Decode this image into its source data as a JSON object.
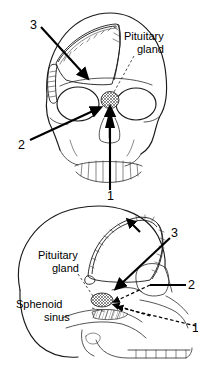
{
  "figure": {
    "stroke_color": "#1a1a1a",
    "background_color": "#ffffff"
  },
  "panels": [
    {
      "id": "frontal-skull",
      "view": "anterior",
      "labels": [
        {
          "id": "pituitary-gland-top",
          "text_line1": "Pituitary",
          "text_line2": "gland",
          "x": 124,
          "y": 37
        }
      ],
      "callouts": [
        {
          "id": "callout-3-top",
          "number": "3",
          "x": 33,
          "y": 25,
          "route": "transcranial craniotomy bone flap"
        },
        {
          "id": "callout-2-top",
          "number": "2",
          "x": 21,
          "y": 146,
          "route": "transethmoidal / lateral rhinotomy"
        },
        {
          "id": "callout-1-top",
          "number": "1",
          "x": 113,
          "y": 196,
          "route": "trans-sphenoidal sublabial"
        }
      ],
      "structures": [
        {
          "id": "cranial-bone-flap",
          "name": "craniotomy bone flap"
        },
        {
          "id": "pituitary-gland-marker",
          "name": "pituitary gland",
          "shape": "cross-hatched oval"
        },
        {
          "id": "orbits",
          "name": "orbital cavities"
        },
        {
          "id": "teeth-upper",
          "name": "upper teeth"
        }
      ]
    },
    {
      "id": "lateral-skull",
      "view": "lateral",
      "labels": [
        {
          "id": "pituitary-gland-bottom",
          "text_line1": "Pituitary",
          "text_line2": "gland",
          "x": 56,
          "y": 256
        },
        {
          "id": "sphenoid-sinus",
          "text_line1": "Sphenoid",
          "text_line2": "sinus",
          "x": 48,
          "y": 305
        }
      ],
      "callouts": [
        {
          "id": "callout-3-bottom",
          "number": "3",
          "x": 175,
          "y": 233,
          "route": "transcranial craniotomy bone flap"
        },
        {
          "id": "callout-2-bottom",
          "number": "2",
          "x": 191,
          "y": 285,
          "route": "transethmoidal"
        },
        {
          "id": "callout-1-bottom",
          "number": "1",
          "x": 194,
          "y": 329,
          "route": "trans-sphenoidal sublabial"
        }
      ],
      "structures": [
        {
          "id": "cranial-bone-flap-lateral",
          "name": "craniotomy bone flap"
        },
        {
          "id": "pituitary-gland-marker-lateral",
          "name": "pituitary gland",
          "shape": "cross-hatched oval"
        },
        {
          "id": "sphenoid-sinus-marker",
          "name": "sphenoid sinus",
          "shape": "hatched region"
        },
        {
          "id": "mandible-teeth",
          "name": "mandible and teeth"
        }
      ]
    }
  ]
}
